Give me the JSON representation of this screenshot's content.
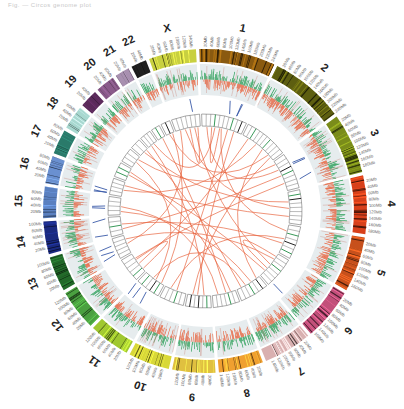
{
  "caption": "Fig. — Circos genome plot",
  "chart_data": {
    "type": "circos",
    "title": "",
    "center": [
      205,
      211
    ],
    "rings": {
      "ideogram": [
        149,
        162
      ],
      "data_track": [
        116,
        147
      ],
      "blue_links_band": [
        100,
        113
      ],
      "box_ring": [
        85,
        97
      ],
      "link_radius": 84
    },
    "gap_degrees": 1.2,
    "chromosomes": [
      {
        "name": "1",
        "size_mb": 249,
        "color": "#8a5a10",
        "ticks": [
          "20Mb",
          "40Mb",
          "60Mb",
          "80Mb",
          "100Mb",
          "120Mb",
          "140Mb",
          "160Mb",
          "180Mb",
          "200Mb",
          "220Mb",
          "240Mb"
        ]
      },
      {
        "name": "2",
        "size_mb": 243,
        "color": "#5d5e10",
        "ticks": [
          "20Mb",
          "40Mb",
          "60Mb",
          "80Mb",
          "100Mb",
          "120Mb",
          "140Mb",
          "160Mb",
          "180Mb",
          "200Mb",
          "220Mb",
          "240Mb"
        ]
      },
      {
        "name": "3",
        "size_mb": 198,
        "color": "#7a8c1a",
        "ticks": [
          "20Mb",
          "40Mb",
          "60Mb",
          "80Mb",
          "100Mb",
          "120Mb",
          "140Mb",
          "160Mb",
          "180Mb"
        ]
      },
      {
        "name": "4",
        "size_mb": 191,
        "color": "#d8401a",
        "ticks": [
          "20Mb",
          "40Mb",
          "60Mb",
          "80Mb",
          "100Mb",
          "120Mb",
          "140Mb",
          "160Mb",
          "180Mb"
        ]
      },
      {
        "name": "5",
        "size_mb": 181,
        "color": "#c7501c",
        "ticks": [
          "20Mb",
          "40Mb",
          "60Mb",
          "80Mb",
          "100Mb",
          "120Mb",
          "140Mb",
          "160Mb"
        ]
      },
      {
        "name": "6",
        "size_mb": 171,
        "color": "#c2507a",
        "ticks": [
          "20Mb",
          "40Mb",
          "60Mb",
          "80Mb",
          "100Mb",
          "120Mb",
          "140Mb",
          "160Mb"
        ]
      },
      {
        "name": "7",
        "size_mb": 159,
        "color": "#d9b0b0",
        "ticks": [
          "20Mb",
          "40Mb",
          "60Mb",
          "80Mb",
          "100Mb",
          "120Mb",
          "140Mb"
        ]
      },
      {
        "name": "8",
        "size_mb": 146,
        "color": "#f0a030",
        "ticks": [
          "20Mb",
          "40Mb",
          "60Mb",
          "80Mb",
          "100Mb",
          "120Mb",
          "140Mb"
        ]
      },
      {
        "name": "9",
        "size_mb": 141,
        "color": "#e0c040",
        "ticks": [
          "20Mb",
          "40Mb",
          "60Mb",
          "80Mb",
          "100Mb",
          "120Mb"
        ]
      },
      {
        "name": "10",
        "size_mb": 135,
        "color": "#d8d838",
        "ticks": [
          "20Mb",
          "40Mb",
          "60Mb",
          "80Mb",
          "100Mb",
          "120Mb"
        ]
      },
      {
        "name": "11",
        "size_mb": 135,
        "color": "#a0c830",
        "ticks": [
          "20Mb",
          "40Mb",
          "60Mb",
          "80Mb",
          "100Mb",
          "120Mb"
        ]
      },
      {
        "name": "12",
        "size_mb": 133,
        "color": "#4aa040",
        "ticks": [
          "20Mb",
          "40Mb",
          "60Mb",
          "80Mb",
          "100Mb",
          "120Mb"
        ]
      },
      {
        "name": "13",
        "size_mb": 115,
        "color": "#236a2a",
        "ticks": [
          "20Mb",
          "40Mb",
          "60Mb",
          "80Mb",
          "100Mb"
        ]
      },
      {
        "name": "14",
        "size_mb": 107,
        "color": "#1a2a80",
        "ticks": [
          "20Mb",
          "40Mb",
          "60Mb",
          "80Mb",
          "100Mb"
        ]
      },
      {
        "name": "15",
        "size_mb": 102,
        "color": "#5a80c0",
        "ticks": [
          "20Mb",
          "40Mb",
          "60Mb",
          "80Mb"
        ]
      },
      {
        "name": "16",
        "size_mb": 90,
        "color": "#6a90d0",
        "ticks": [
          "20Mb",
          "40Mb",
          "60Mb",
          "80Mb"
        ]
      },
      {
        "name": "17",
        "size_mb": 81,
        "color": "#2a7a6a",
        "ticks": [
          "20Mb",
          "40Mb",
          "60Mb",
          "80Mb"
        ]
      },
      {
        "name": "18",
        "size_mb": 78,
        "color": "#a8d8d0",
        "ticks": [
          "20Mb",
          "40Mb",
          "60Mb"
        ]
      },
      {
        "name": "19",
        "size_mb": 59,
        "color": "#5a2a5a",
        "ticks": [
          "20Mb",
          "40Mb"
        ]
      },
      {
        "name": "20",
        "size_mb": 63,
        "color": "#8a5a8a",
        "ticks": [
          "20Mb",
          "40Mb",
          "60Mb"
        ]
      },
      {
        "name": "21",
        "size_mb": 48,
        "color": "#a890b0",
        "ticks": [
          "20Mb",
          "40Mb"
        ]
      },
      {
        "name": "22",
        "size_mb": 51,
        "color": "#202020",
        "ticks": [
          "20Mb",
          "40Mb"
        ]
      },
      {
        "name": "X",
        "size_mb": 155,
        "color": "#c8d040",
        "ticks": [
          "20Mb",
          "40Mb",
          "60Mb",
          "80Mb",
          "100Mb",
          "120Mb",
          "140Mb"
        ]
      }
    ],
    "track_colors": {
      "gain": "#2ea05a",
      "loss": "#e8603a",
      "track_bg": "#e6ecee",
      "blue_marks": "#3a5aa8",
      "box_green": "#3a9a5a",
      "box_black": "#222222",
      "links": "#e8603a"
    },
    "links": [
      [
        [
          "1",
          30
        ],
        [
          "3",
          60
        ]
      ],
      [
        [
          "1",
          120
        ],
        [
          "5",
          40
        ]
      ],
      [
        [
          "1",
          200
        ],
        [
          "9",
          80
        ]
      ],
      [
        [
          "2",
          40
        ],
        [
          "12",
          60
        ]
      ],
      [
        [
          "2",
          150
        ],
        [
          "7",
          20
        ]
      ],
      [
        [
          "X",
          60
        ],
        [
          "4",
          100
        ]
      ],
      [
        [
          "X",
          120
        ],
        [
          "6",
          80
        ]
      ],
      [
        [
          "22",
          20
        ],
        [
          "2",
          200
        ]
      ],
      [
        [
          "21",
          30
        ],
        [
          "8",
          60
        ]
      ],
      [
        [
          "20",
          40
        ],
        [
          "1",
          80
        ]
      ],
      [
        [
          "19",
          30
        ],
        [
          "4",
          60
        ]
      ],
      [
        [
          "18",
          40
        ],
        [
          "11",
          60
        ]
      ],
      [
        [
          "17",
          40
        ],
        [
          "6",
          130
        ]
      ],
      [
        [
          "16",
          40
        ],
        [
          "2",
          100
        ]
      ],
      [
        [
          "15",
          50
        ],
        [
          "8",
          110
        ]
      ],
      [
        [
          "14",
          60
        ],
        [
          "5",
          120
        ]
      ],
      [
        [
          "13",
          60
        ],
        [
          "X",
          30
        ]
      ],
      [
        [
          "12",
          100
        ],
        [
          "3",
          150
        ]
      ],
      [
        [
          "11",
          80
        ],
        [
          "7",
          100
        ]
      ],
      [
        [
          "10",
          60
        ],
        [
          "1",
          160
        ]
      ],
      [
        [
          "9",
          40
        ],
        [
          "20",
          20
        ]
      ],
      [
        [
          "8",
          30
        ],
        [
          "17",
          60
        ]
      ],
      [
        [
          "7",
          60
        ],
        [
          "15",
          20
        ]
      ],
      [
        [
          "6",
          40
        ],
        [
          "13",
          90
        ]
      ],
      [
        [
          "5",
          90
        ],
        [
          "10",
          100
        ]
      ],
      [
        [
          "4",
          150
        ],
        [
          "16",
          70
        ]
      ],
      [
        [
          "3",
          100
        ],
        [
          "14",
          30
        ]
      ],
      [
        [
          "2",
          220
        ],
        [
          "9",
          110
        ]
      ],
      [
        [
          "1",
          60
        ],
        [
          "1",
          110
        ]
      ],
      [
        [
          "X",
          90
        ],
        [
          "X",
          140
        ]
      ],
      [
        [
          "12",
          20
        ],
        [
          "12",
          90
        ]
      ],
      [
        [
          "6",
          20
        ],
        [
          "6",
          110
        ]
      ],
      [
        [
          "3",
          20
        ],
        [
          "18",
          60
        ]
      ],
      [
        [
          "11",
          20
        ],
        [
          "22",
          40
        ]
      ],
      [
        [
          "7",
          130
        ],
        [
          "19",
          50
        ]
      ]
    ]
  }
}
